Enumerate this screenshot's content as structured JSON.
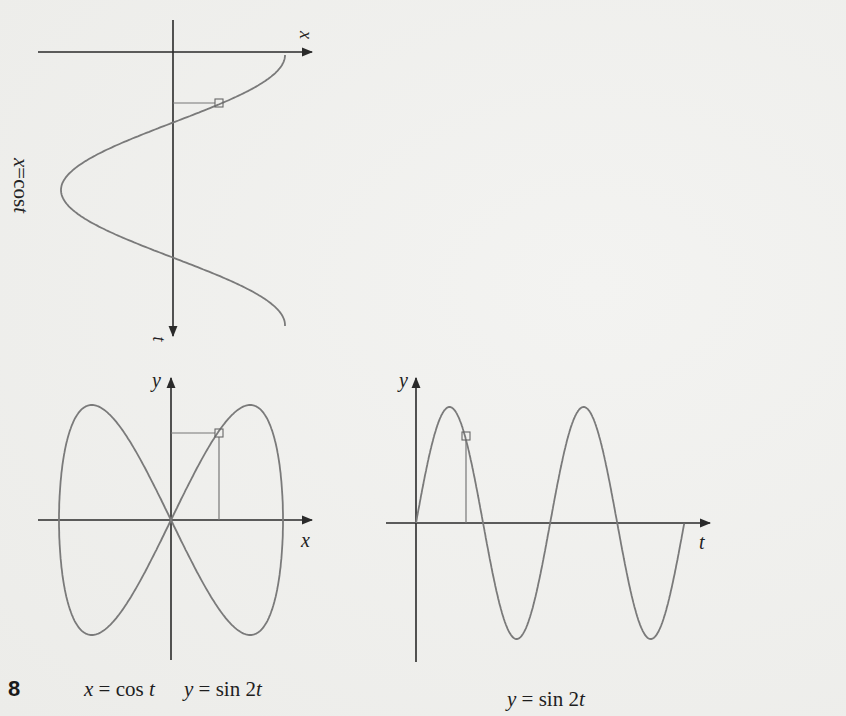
{
  "figure": {
    "number": "8",
    "top_graph": {
      "rotated_label": {
        "var": "x",
        "eq": " = ",
        "fn": "cos ",
        "arg": "t"
      },
      "axis_x_label": "x",
      "axis_t_label": "t"
    },
    "left_graph": {
      "axis_x_label": "x",
      "axis_y_label": "y",
      "caption_x": {
        "var": "x",
        "eq": " = ",
        "fn": "cos ",
        "arg": "t"
      },
      "caption_y": {
        "var": "y",
        "eq": " = ",
        "fn": "sin 2",
        "arg": "t"
      }
    },
    "right_graph": {
      "axis_t_label": "t",
      "axis_y_label": "y",
      "caption": {
        "var": "y",
        "eq": " = ",
        "fn": "sin 2",
        "arg": "t"
      }
    },
    "colors": {
      "axis": "#2a2a2a",
      "curve": "#7a7a7a",
      "background": "#efefed",
      "text": "#1e1e1e"
    }
  },
  "chart_data": [
    {
      "type": "line",
      "title": "x = cos t (rotated: t downward, x rightward)",
      "xlabel": "x",
      "ylabel": "t",
      "x_range": [
        -1,
        1
      ],
      "t_range": [
        0,
        6.3
      ],
      "function": "x = cos t",
      "marker": {
        "t": 1.15,
        "x": 0.41
      },
      "grid": false
    },
    {
      "type": "line",
      "title": "x = cos t, y = sin 2t (parametric)",
      "xlabel": "x",
      "ylabel": "y",
      "x_range": [
        -1,
        1
      ],
      "y_range": [
        -1,
        1
      ],
      "function": "x = cos t, y = sin 2t, 0 ≤ t ≤ 2π",
      "marker": {
        "x": 0.43,
        "y": 0.77
      },
      "grid": false
    },
    {
      "type": "line",
      "title": "y = sin 2t",
      "xlabel": "t",
      "ylabel": "y",
      "t_range": [
        0,
        6.28
      ],
      "y_range": [
        -1,
        1
      ],
      "function": "y = sin 2t",
      "peaks_t": [
        0.785,
        3.927
      ],
      "troughs_t": [
        2.356,
        5.498
      ],
      "zeros_t": [
        0,
        1.571,
        3.142,
        4.712,
        6.283
      ],
      "marker": {
        "t": 1.13,
        "y": 0.77
      },
      "grid": false
    }
  ]
}
